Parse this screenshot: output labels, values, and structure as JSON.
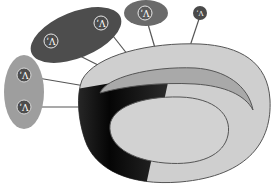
{
  "diagram": {
    "type": "anatomical-schematic",
    "colors": {
      "background": "#ffffff",
      "outer_body": "#cfcfcf",
      "inner_crescent": "#a9a9a9",
      "inner_ellipse": "#d2d2d2",
      "dark_band": "#141414",
      "outline": "#555555",
      "group_dark": "#4d4d4d",
      "group_medium": "#6a6a6a",
      "group_light": "#9e9e9e",
      "leader_line": "#555555"
    },
    "groups": [
      {
        "id": "group-large-dark",
        "shape": "ellipse",
        "markers": [
          {
            "label": "ʹΛ"
          },
          {
            "label": "ʹΛ"
          }
        ]
      },
      {
        "id": "group-small-dark",
        "shape": "ellipse",
        "markers": [
          {
            "label": "ʹΛ"
          }
        ]
      },
      {
        "id": "group-single",
        "shape": "circle",
        "markers": [
          {
            "label": "ʹΛ"
          }
        ]
      },
      {
        "id": "group-left-light",
        "shape": "ellipse",
        "markers": [
          {
            "label": "ʹΛ"
          },
          {
            "label": "ʹΛ"
          }
        ]
      }
    ]
  }
}
